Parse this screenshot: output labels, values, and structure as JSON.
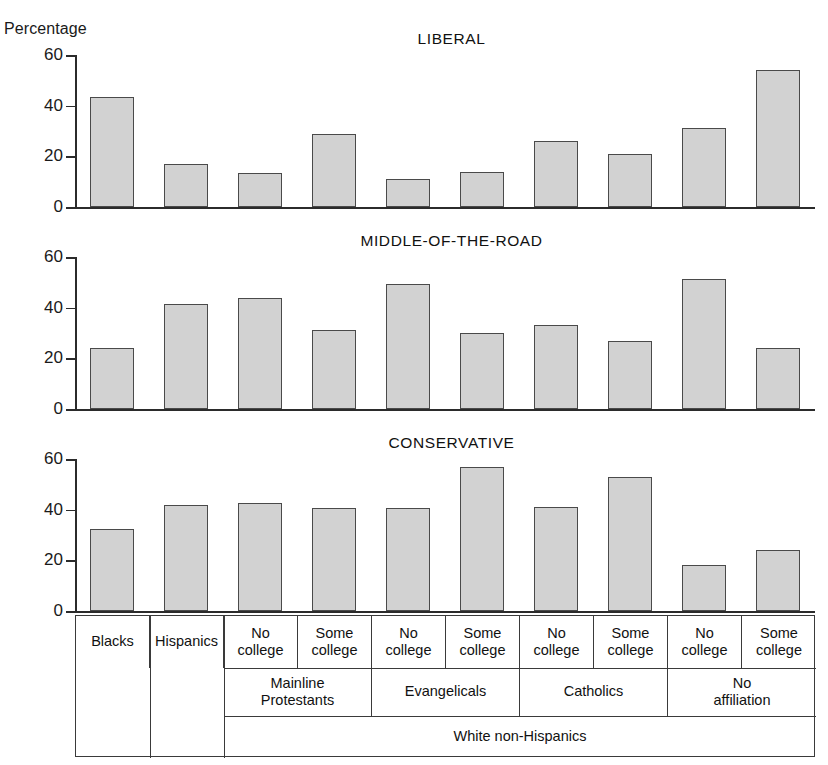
{
  "axis": {
    "y_caption": "Percentage",
    "ticks": [
      0,
      20,
      40,
      60
    ],
    "ymin": 0,
    "ymax": 60
  },
  "panels": [
    {
      "title": "LIBERAL"
    },
    {
      "title": "MIDDLE-OF-THE-ROAD"
    },
    {
      "title": "CONSERVATIVE"
    }
  ],
  "table": {
    "columns": [
      {
        "line1": "Blacks",
        "line2": ""
      },
      {
        "line1": "Hispanics",
        "line2": ""
      },
      {
        "line1": "No",
        "line2": "college"
      },
      {
        "line1": "Some",
        "line2": "college"
      },
      {
        "line1": "No",
        "line2": "college"
      },
      {
        "line1": "Some",
        "line2": "college"
      },
      {
        "line1": "No",
        "line2": "college"
      },
      {
        "line1": "Some",
        "line2": "college"
      },
      {
        "line1": "No",
        "line2": "college"
      },
      {
        "line1": "Some",
        "line2": "college"
      }
    ],
    "groups": [
      {
        "line1": "Mainline",
        "line2": "Protestants",
        "start": 2,
        "span": 2
      },
      {
        "line1": "Evangelicals",
        "line2": "",
        "start": 4,
        "span": 2
      },
      {
        "line1": "Catholics",
        "line2": "",
        "start": 6,
        "span": 2
      },
      {
        "line1": "No",
        "line2": "affiliation",
        "start": 8,
        "span": 2
      }
    ],
    "supergroup": {
      "label": "White non-Hispanics",
      "start": 2,
      "span": 8
    }
  },
  "chart_data": {
    "type": "bar",
    "xlabel": "",
    "ylabel": "Percentage",
    "ylim": [
      0,
      60
    ],
    "yticks": [
      0,
      20,
      40,
      60
    ],
    "grid": false,
    "legend": "none",
    "categories": [
      "Blacks",
      "Hispanics",
      "White non-Hispanics / Mainline Protestants / No college",
      "White non-Hispanics / Mainline Protestants / Some college",
      "White non-Hispanics / Evangelicals / No college",
      "White non-Hispanics / Evangelicals / Some college",
      "White non-Hispanics / Catholics / No college",
      "White non-Hispanics / Catholics / Some college",
      "White non-Hispanics / No affiliation / No college",
      "White non-Hispanics / No affiliation / Some college"
    ],
    "panels": [
      {
        "title": "LIBERAL",
        "values": [
          43.5,
          17,
          13.5,
          29,
          11,
          14,
          26,
          21,
          31,
          54
        ]
      },
      {
        "title": "MIDDLE-OF-THE-ROAD",
        "values": [
          24,
          41.5,
          44,
          31,
          49.5,
          30,
          33,
          27,
          51.5,
          24
        ]
      },
      {
        "title": "CONSERVATIVE",
        "values": [
          32.5,
          42,
          42.5,
          40.5,
          40.5,
          57,
          41,
          53,
          18,
          24
        ]
      }
    ],
    "colors": {
      "bar_fill": "#d2d2d2",
      "bar_stroke": "#4a4a4a",
      "axis": "#2b2b2b"
    }
  }
}
